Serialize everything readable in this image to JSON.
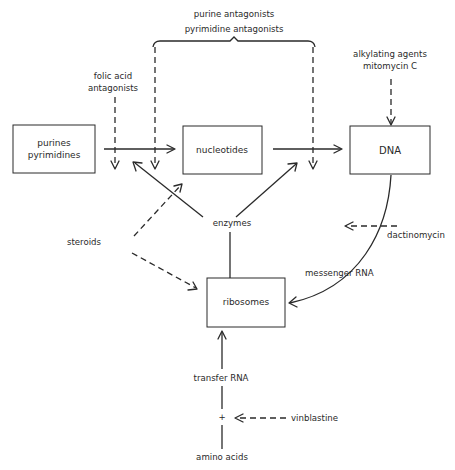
{
  "diagram": {
    "nodes": {
      "purines": {
        "line1": "purines",
        "line2": "pyrimidines"
      },
      "nucleotides": {
        "label": "nucleotides"
      },
      "dna": {
        "label": "DNA"
      },
      "ribosomes": {
        "label": "ribosomes"
      }
    },
    "labels": {
      "purine_antagonists": "purine antagonists",
      "pyrimidine_antagonists": "pyrimidine antagonists",
      "folic_acid_line1": "folic acid",
      "folic_acid_line2": "antagonists",
      "alkylating_line1": "alkylating agents",
      "alkylating_line2": "mitomycin C",
      "enzymes": "enzymes",
      "steroids": "steroids",
      "dactinomycin": "dactinomycin",
      "messenger_rna": "messenger RNA",
      "transfer_rna": "transfer RNA",
      "plus": "+",
      "vinblastine": "vinblastine",
      "amino_acids": "amino acids"
    },
    "edges": [
      {
        "from": "purines/pyrimidines",
        "to": "nucleotides",
        "style": "solid"
      },
      {
        "from": "nucleotides",
        "to": "DNA",
        "style": "solid"
      },
      {
        "from": "DNA",
        "to": "ribosomes",
        "via": "messenger RNA",
        "style": "solid-curve"
      },
      {
        "from": "ribosomes",
        "to": "enzymes",
        "style": "solid"
      },
      {
        "from": "enzymes",
        "to": "purines->nucleotides step",
        "style": "solid"
      },
      {
        "from": "enzymes",
        "to": "nucleotides->DNA step",
        "style": "solid"
      },
      {
        "from": "amino acids",
        "to": "ribosomes",
        "via": "transfer RNA",
        "style": "solid"
      },
      {
        "from": "folic acid antagonists",
        "to": "purines->nucleotides step",
        "style": "dashed"
      },
      {
        "from": "purine/pyrimidine antagonists",
        "to": "purines->nucleotides step",
        "style": "dashed"
      },
      {
        "from": "purine/pyrimidine antagonists",
        "to": "nucleotides->DNA step",
        "style": "dashed"
      },
      {
        "from": "alkylating agents / mitomycin C",
        "to": "DNA",
        "style": "dashed"
      },
      {
        "from": "steroids",
        "to": "nucleotides",
        "style": "dashed"
      },
      {
        "from": "steroids",
        "to": "ribosomes",
        "style": "dashed"
      },
      {
        "from": "dactinomycin",
        "to": "messenger RNA",
        "style": "dashed"
      },
      {
        "from": "vinblastine",
        "to": "transfer RNA step",
        "style": "dashed"
      }
    ],
    "colors": {
      "ink": "#2a2a2a",
      "background": "#ffffff"
    }
  }
}
